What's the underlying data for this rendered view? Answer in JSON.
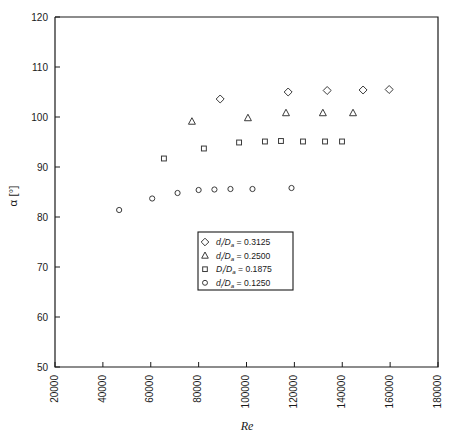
{
  "chart_data": {
    "type": "scatter",
    "title": "",
    "xlabel": "Re",
    "ylabel": "α [°]",
    "xlim": [
      20000,
      180000
    ],
    "ylim": [
      50,
      120
    ],
    "xticks": [
      20000,
      40000,
      60000,
      80000,
      100000,
      120000,
      140000,
      160000,
      180000
    ],
    "xtick_labels": [
      "20000",
      "40000",
      "60000",
      "80000",
      "100000",
      "120000",
      "140000",
      "160000",
      "180000"
    ],
    "yticks": [
      50,
      60,
      70,
      80,
      90,
      100,
      110,
      120
    ],
    "ytick_labels": [
      "50",
      "60",
      "70",
      "80",
      "90",
      "100",
      "110",
      "120"
    ],
    "grid": false,
    "xtick_rotation": 90,
    "legend_position": "center",
    "series": [
      {
        "name": "d_i/D_a = 0.3125",
        "marker": "diamond",
        "label_num": "d",
        "label_sub1": "i",
        "label_den": "D",
        "label_sub2": "a",
        "label_value": "0.3125",
        "points": [
          {
            "x": 89000,
            "y": 103.6
          },
          {
            "x": 117400,
            "y": 105.0
          },
          {
            "x": 133700,
            "y": 105.3
          },
          {
            "x": 148700,
            "y": 105.4
          },
          {
            "x": 159600,
            "y": 105.5
          }
        ]
      },
      {
        "name": "d_i/D_a = 0.2500",
        "marker": "triangle",
        "label_num": "d",
        "label_sub1": "i",
        "label_den": "D",
        "label_sub2": "a",
        "label_value": "0.2500",
        "points": [
          {
            "x": 77200,
            "y": 99.1
          },
          {
            "x": 100600,
            "y": 99.8
          },
          {
            "x": 116500,
            "y": 100.8
          },
          {
            "x": 131900,
            "y": 100.8
          },
          {
            "x": 144500,
            "y": 100.8
          }
        ]
      },
      {
        "name": "D_i/D_a = 0.1875",
        "marker": "square",
        "label_num": "D",
        "label_sub1": "i",
        "label_den": "D",
        "label_sub2": "a",
        "label_value": "0.1875",
        "points": [
          {
            "x": 65500,
            "y": 91.7
          },
          {
            "x": 82200,
            "y": 93.7
          },
          {
            "x": 96900,
            "y": 94.9
          },
          {
            "x": 107700,
            "y": 95.1
          },
          {
            "x": 114400,
            "y": 95.2
          },
          {
            "x": 123600,
            "y": 95.1
          },
          {
            "x": 132800,
            "y": 95.1
          },
          {
            "x": 139900,
            "y": 95.1
          }
        ]
      },
      {
        "name": "d_i/D_a = 0.1250",
        "marker": "circle",
        "label_num": "d",
        "label_sub1": "i",
        "label_den": "D",
        "label_sub2": "a",
        "label_value": "0.1250",
        "points": [
          {
            "x": 46800,
            "y": 81.4
          },
          {
            "x": 60600,
            "y": 83.7
          },
          {
            "x": 71200,
            "y": 84.8
          },
          {
            "x": 80000,
            "y": 85.4
          },
          {
            "x": 86600,
            "y": 85.5
          },
          {
            "x": 93300,
            "y": 85.6
          },
          {
            "x": 102500,
            "y": 85.6
          },
          {
            "x": 118800,
            "y": 85.8
          }
        ]
      }
    ]
  },
  "legend": {
    "equals": "=",
    "slash": "/"
  }
}
